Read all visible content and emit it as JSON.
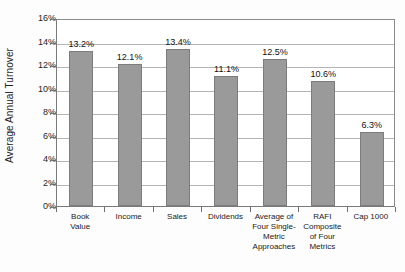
{
  "chart_data": {
    "type": "bar",
    "title": "",
    "subtitle": "",
    "xlabel": "",
    "ylabel": "Average Annual Turnover",
    "categories": [
      "Book Value",
      "Income",
      "Sales",
      "Dividends",
      "Average of Four Single-Metric Approaches",
      "RAFI Composite of Four Metrics",
      "Cap 1000"
    ],
    "category_lines": [
      [
        "Book",
        "Value"
      ],
      [
        "Income"
      ],
      [
        "Sales"
      ],
      [
        "Dividends"
      ],
      [
        "Average of",
        "Four Single-",
        "Metric",
        "Approaches"
      ],
      [
        "RAFI",
        "Composite",
        "of Four",
        "Metrics"
      ],
      [
        "Cap 1000"
      ]
    ],
    "values": [
      13.2,
      12.1,
      13.4,
      11.1,
      12.5,
      10.6,
      6.3
    ],
    "data_labels": [
      "13.2%",
      "12.1%",
      "13.4%",
      "11.1%",
      "12.5%",
      "10.6%",
      "6.3%"
    ],
    "ylim": [
      0,
      16
    ],
    "ytick_values": [
      0,
      2,
      4,
      6,
      8,
      10,
      12,
      14,
      16
    ],
    "ytick_labels": [
      "0%",
      "2%",
      "4%",
      "6%",
      "8%",
      "10%",
      "12%",
      "14%",
      "16%"
    ],
    "grid": true,
    "legend": false,
    "legend_position": "none",
    "bar_color": "#9a9a9a",
    "bar_border_color": "#7c7c7c",
    "gridline_color": "#b4b4b4",
    "axis_color": "#7a7a7a",
    "plot_background": "#ffffff"
  }
}
